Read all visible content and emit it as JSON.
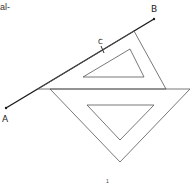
{
  "page": {
    "text_fragment": "al-",
    "page_number": "1"
  },
  "diagram": {
    "labels": {
      "a": "A",
      "b": "B",
      "c": "C"
    },
    "colors": {
      "line": "#1a1a1a",
      "outline": "#555555"
    }
  }
}
